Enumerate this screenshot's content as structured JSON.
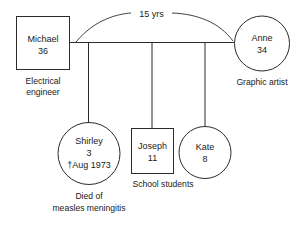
{
  "diagram": {
    "type": "genogram",
    "stroke_color": "#2b2b2b",
    "background_color": "#ffffff"
  },
  "relationship": {
    "duration_label": "15 yrs",
    "partners": [
      "Michael",
      "Anne"
    ]
  },
  "people": [
    {
      "id": "michael",
      "shape": "square",
      "sex": "male",
      "name": "Michael",
      "age": "36",
      "caption_lines": [
        "Electrical",
        "engineer"
      ]
    },
    {
      "id": "anne",
      "shape": "circle",
      "sex": "female",
      "name": "Anne",
      "age": "34",
      "caption_lines": [
        "Graphic artist"
      ]
    },
    {
      "id": "shirley",
      "shape": "circle",
      "sex": "female",
      "name": "Shirley",
      "age": "3",
      "death_marker": "†Aug 1973",
      "caption_lines": [
        "Died of",
        "measles meningitis"
      ]
    },
    {
      "id": "joseph",
      "shape": "square",
      "sex": "male",
      "name": "Joseph",
      "age": "11",
      "caption_lines": []
    },
    {
      "id": "kate",
      "shape": "circle",
      "sex": "female",
      "name": "Kate",
      "age": "8",
      "caption_lines": []
    }
  ],
  "group_captions": [
    {
      "id": "school-students",
      "text": "School students"
    }
  ]
}
